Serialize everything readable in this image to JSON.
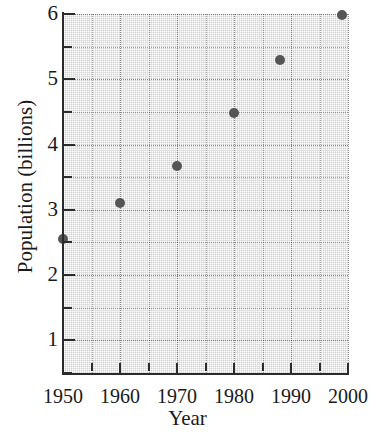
{
  "chart_data": {
    "type": "scatter",
    "title": "",
    "xlabel": "Year",
    "ylabel": "Population (billions)",
    "xlim": [
      1950,
      2000
    ],
    "ylim": [
      0.5,
      6.0
    ],
    "grid": true,
    "legend": null,
    "x": [
      1950,
      1960,
      1970,
      1980,
      1988,
      1999
    ],
    "y": [
      2.55,
      3.1,
      3.67,
      4.48,
      5.3,
      5.98
    ],
    "points": [
      {
        "x": 1950,
        "y": 2.55
      },
      {
        "x": 1960,
        "y": 3.1
      },
      {
        "x": 1970,
        "y": 3.67
      },
      {
        "x": 1980,
        "y": 4.48
      },
      {
        "x": 1988,
        "y": 5.3
      },
      {
        "x": 1999,
        "y": 5.98
      }
    ],
    "marker_color": "#555558",
    "marker_size": 10,
    "x_ticks_major": [
      1950,
      1960,
      1970,
      1980,
      1990,
      2000
    ],
    "x_ticks_minor": [
      1955,
      1965,
      1975,
      1985,
      1995
    ],
    "x_tick_labels": [
      "1950",
      "1960",
      "1970",
      "1980",
      "1990",
      "2000"
    ],
    "y_ticks_major": [
      1,
      2,
      3,
      4,
      5,
      6
    ],
    "y_ticks_minor": [
      0.5,
      1.5,
      2.5,
      3.5,
      4.5,
      5.5
    ],
    "y_tick_labels": [
      "1",
      "2",
      "3",
      "4",
      "5",
      "6"
    ],
    "axis_color": "#2b2b2b",
    "grid_color": "#cfcfcf",
    "background_color": "#ffffff"
  },
  "axis": {
    "x_title": "Year",
    "y_title": "Population (billions)"
  }
}
